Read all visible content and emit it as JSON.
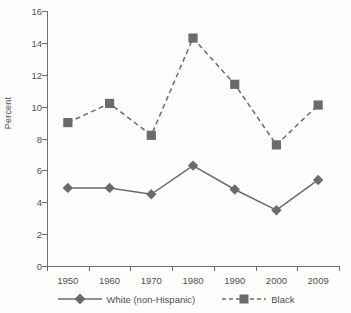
{
  "chart_data": {
    "type": "line",
    "title": "",
    "xlabel": "",
    "ylabel": "Percent",
    "categories": [
      "1950",
      "1960",
      "1970",
      "1980",
      "1990",
      "2000",
      "2009"
    ],
    "ylim": [
      0,
      16
    ],
    "yticks": [
      0,
      2,
      4,
      6,
      8,
      10,
      12,
      14,
      16
    ],
    "grid": false,
    "legend_position": "bottom",
    "series": [
      {
        "name": "White (non-Hispanic)",
        "marker": "diamond",
        "linestyle": "solid",
        "color": "#6b6b6b",
        "values": [
          4.9,
          4.9,
          4.5,
          6.3,
          4.8,
          3.5,
          5.4
        ]
      },
      {
        "name": "Black",
        "marker": "square",
        "linestyle": "dashed",
        "color": "#6b6b6b",
        "values": [
          9.0,
          10.2,
          8.2,
          14.3,
          11.4,
          7.6,
          10.1
        ]
      }
    ]
  },
  "axes": {
    "y_title": "Percent",
    "y_tick_labels": [
      "16",
      "14",
      "12",
      "10",
      "8",
      "6",
      "4",
      "2",
      "0"
    ],
    "x_tick_labels": [
      "1950",
      "1960",
      "1970",
      "1980",
      "1990",
      "2000",
      "2009"
    ]
  },
  "legend": {
    "entries": [
      {
        "label": "White (non-Hispanic)",
        "marker": "diamond-marker",
        "line": "solid-line"
      },
      {
        "label": "Black",
        "marker": "square-marker",
        "line": "dashed-line"
      }
    ]
  },
  "colors": {
    "ink": "#6b6b6b",
    "axis": "#6d6d6d",
    "text": "#4f4f4f",
    "background": "#fdfdfc"
  }
}
